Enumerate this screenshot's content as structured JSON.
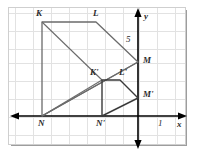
{
  "figure": {
    "type": "coordinate-geometry-diagram",
    "grid": {
      "cell_px": 18,
      "color": "#e2e2e2",
      "visible": true
    },
    "axes": {
      "x_label": "x",
      "y_label": "y",
      "x_tick_label": "1",
      "y_tick_label": "5",
      "color": "#000000",
      "origin_px": {
        "x": 138,
        "y": 116
      }
    },
    "shapes": [
      {
        "name": "KLMN",
        "stroke": "#6b6b6b",
        "vertices": [
          {
            "label": "K",
            "px": [
              42,
              22
            ],
            "grid": [
              -5.33,
              5.22
            ]
          },
          {
            "label": "L",
            "px": [
              96,
              22
            ],
            "grid": [
              -2.33,
              5.22
            ]
          },
          {
            "label": "M",
            "px": [
              138,
              62
            ],
            "grid": [
              0,
              3
            ]
          },
          {
            "label": "N",
            "px": [
              42,
              116
            ],
            "grid": [
              -5.33,
              0
            ]
          }
        ]
      },
      {
        "name": "K'L'M'N'",
        "stroke": "#3a3a3a",
        "vertices": [
          {
            "label": "K'",
            "px": [
              102,
              80
            ],
            "grid": [
              -2,
              2
            ]
          },
          {
            "label": "L'",
            "px": [
              120,
              80
            ],
            "grid": [
              -1,
              2
            ]
          },
          {
            "label": "M'",
            "px": [
              138,
              98
            ],
            "grid": [
              0,
              1
            ]
          },
          {
            "label": "N'",
            "px": [
              102,
              116
            ],
            "grid": [
              -2,
              0
            ]
          }
        ]
      }
    ],
    "rays": [
      {
        "name": "ray-N-to-K",
        "from": "N",
        "through": "K'",
        "to": "K"
      },
      {
        "name": "ray-N-to-M",
        "from": "N",
        "through": "M'",
        "to": "M"
      }
    ],
    "labels": {
      "K": "K",
      "L": "L",
      "M": "M",
      "N": "N",
      "K_prime": "K'",
      "L_prime": "L'",
      "M_prime": "M'",
      "N_prime": "N'",
      "five": "5",
      "one": "1",
      "x_axis": "x",
      "y_axis": "y"
    }
  }
}
